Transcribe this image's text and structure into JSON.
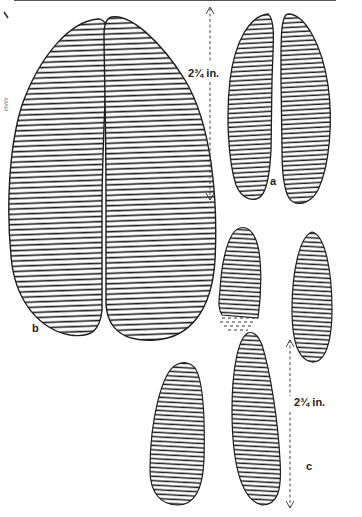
{
  "figure": {
    "title": "",
    "prints": [
      {
        "id": "b",
        "label": "b",
        "description": "Large hoofprint, two elongated halves"
      },
      {
        "id": "a",
        "label": "a",
        "description": "Smaller hoofprint, two halves",
        "measurement": "2¾ in."
      },
      {
        "id": "c",
        "label": "c",
        "description": "Spread hoofprint pair, staggered halves",
        "measurement": "2¾ in."
      }
    ],
    "margin_mark": "\\",
    "side_note": "MAR"
  },
  "colors": {
    "ink": "#1e1e1e",
    "paper": "#ffffff"
  }
}
